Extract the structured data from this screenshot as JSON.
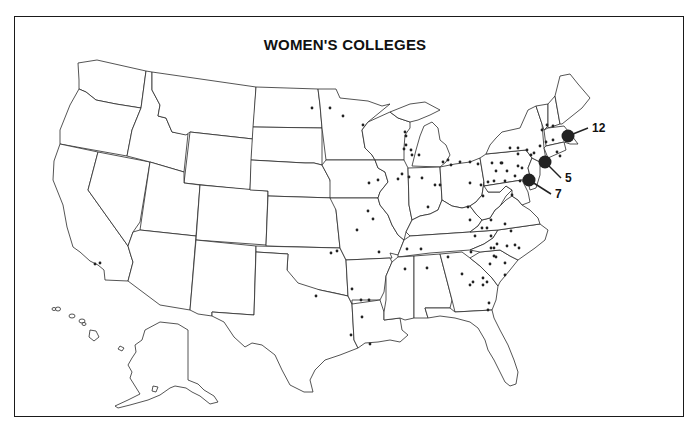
{
  "title": "WOMEN'S COLLEGES",
  "map": {
    "subject": "United States",
    "insets": [
      "Alaska",
      "Hawaii"
    ],
    "marker_color": "#222222",
    "line_color": "#2a2a2a",
    "background": "#ffffff"
  },
  "clusters": [
    {
      "label": "12",
      "region": "Boston area",
      "cx": 568,
      "cy": 136,
      "lx": 592,
      "ly": 132
    },
    {
      "label": "5",
      "region": "New York City area",
      "cx": 545,
      "cy": 162,
      "lx": 565,
      "ly": 182
    },
    {
      "label": "7",
      "region": "Philadelphia area",
      "cx": 529,
      "cy": 180,
      "lx": 555,
      "ly": 198
    }
  ],
  "dots": [
    [
      100,
      263
    ],
    [
      95,
      264
    ],
    [
      312,
      108
    ],
    [
      330,
      108
    ],
    [
      343,
      116
    ],
    [
      363,
      125
    ],
    [
      405,
      132
    ],
    [
      406,
      136
    ],
    [
      406,
      145
    ],
    [
      411,
      150
    ],
    [
      404,
      149
    ],
    [
      419,
      155
    ],
    [
      412,
      155
    ],
    [
      331,
      253
    ],
    [
      352,
      289
    ],
    [
      361,
      300
    ],
    [
      369,
      300
    ],
    [
      362,
      317
    ],
    [
      351,
      335
    ],
    [
      370,
      344
    ],
    [
      428,
      207
    ],
    [
      468,
      207
    ],
    [
      448,
      257
    ],
    [
      470,
      220
    ],
    [
      475,
      236
    ],
    [
      482,
      228
    ],
    [
      487,
      228
    ],
    [
      491,
      220
    ],
    [
      505,
      224
    ],
    [
      491,
      236
    ],
    [
      494,
      248
    ],
    [
      497,
      244
    ],
    [
      491,
      248
    ],
    [
      496,
      257
    ],
    [
      490,
      264
    ],
    [
      494,
      256
    ],
    [
      511,
      231
    ],
    [
      515,
      245
    ],
    [
      519,
      248
    ],
    [
      507,
      246
    ],
    [
      505,
      263
    ],
    [
      505,
      275
    ],
    [
      483,
      278
    ],
    [
      483,
      285
    ],
    [
      487,
      282
    ],
    [
      489,
      303
    ],
    [
      488,
      310
    ],
    [
      473,
      282
    ],
    [
      470,
      285
    ],
    [
      462,
      274
    ],
    [
      471,
      252
    ],
    [
      427,
      268
    ],
    [
      421,
      249
    ],
    [
      407,
      249
    ],
    [
      405,
      269
    ],
    [
      510,
      148
    ],
    [
      518,
      148
    ],
    [
      505,
      181
    ],
    [
      520,
      181
    ],
    [
      512,
      195
    ],
    [
      494,
      181
    ],
    [
      488,
      182
    ],
    [
      470,
      183
    ],
    [
      481,
      185
    ],
    [
      483,
      196
    ],
    [
      496,
      171
    ],
    [
      507,
      171
    ],
    [
      515,
      176
    ],
    [
      518,
      166
    ],
    [
      522,
      168
    ],
    [
      502,
      163
    ],
    [
      542,
      130
    ],
    [
      547,
      125
    ],
    [
      553,
      126
    ],
    [
      546,
      142
    ],
    [
      553,
      140
    ],
    [
      557,
      152
    ],
    [
      560,
      156
    ],
    [
      540,
      146
    ],
    [
      534,
      153
    ],
    [
      527,
      150
    ],
    [
      531,
      155
    ],
    [
      518,
      154
    ],
    [
      501,
      163
    ],
    [
      492,
      163
    ],
    [
      478,
      164
    ],
    [
      470,
      162
    ],
    [
      460,
      162
    ],
    [
      451,
      165
    ],
    [
      448,
      160
    ],
    [
      443,
      162
    ],
    [
      435,
      185
    ],
    [
      440,
      185
    ],
    [
      422,
      178
    ],
    [
      409,
      177
    ],
    [
      398,
      179
    ],
    [
      378,
      180
    ],
    [
      369,
      183
    ],
    [
      368,
      211
    ],
    [
      373,
      219
    ],
    [
      357,
      230
    ],
    [
      337,
      251
    ],
    [
      316,
      296
    ],
    [
      379,
      252
    ],
    [
      402,
      174
    ]
  ],
  "annotations": []
}
